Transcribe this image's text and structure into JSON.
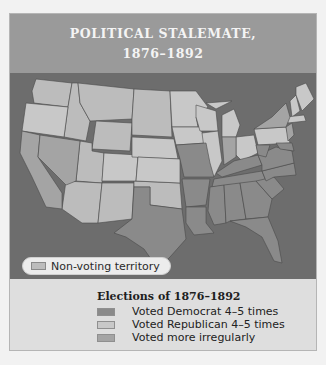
{
  "title": {
    "line1": "POLITICAL STALEMATE,",
    "line2": "1876–1892"
  },
  "map": {
    "non_voting_legend": "Non-voting territory",
    "colors": {
      "background_water": "#6d6d6d",
      "democrat": "#8a8a8a",
      "republican": "#c8c8c8",
      "irregular": "#a4a4a4",
      "non_voting": "#bcbcbc"
    }
  },
  "legend": {
    "title": "Elections of 1876–1892",
    "items": [
      {
        "label": "Voted Democrat 4–5 times",
        "color": "#8a8a8a"
      },
      {
        "label": "Voted Republican 4–5 times",
        "color": "#c8c8c8"
      },
      {
        "label": "Voted more irregularly",
        "color": "#a4a4a4"
      }
    ]
  }
}
